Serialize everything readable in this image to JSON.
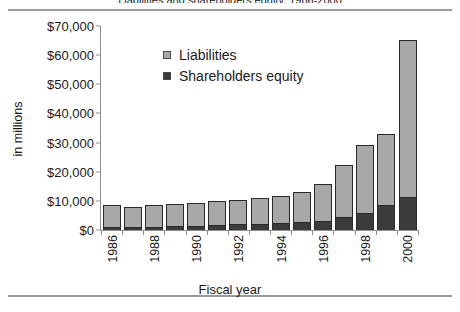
{
  "figure": {
    "title": "Liabilities and shareholders equity, 1986-2000",
    "y_axis_label": "in millions",
    "x_axis_label": "Fiscal year"
  },
  "legend": {
    "items": [
      {
        "label": "Liabilities",
        "color": "#a8a8a8",
        "swatch": "legend-swatch-liabilities"
      },
      {
        "label": "Shareholders equity",
        "color": "#3b3b3b",
        "swatch": "legend-swatch-equity"
      }
    ]
  },
  "axes": {
    "y_ticks": [
      "$70,000",
      "$60,000",
      "$50,000",
      "$40,000",
      "$30,000",
      "$20,000",
      "$10,000",
      "$0"
    ],
    "x_ticks_visible": [
      "1986",
      "1988",
      "1990",
      "1992",
      "1994",
      "1996",
      "1998",
      "2000"
    ]
  },
  "chart_data": {
    "type": "bar",
    "stacked": true,
    "title": "Liabilities and shareholders equity, 1986-2000",
    "xlabel": "Fiscal year",
    "ylabel": "in millions",
    "ylim": [
      0,
      70000
    ],
    "ytick_step": 10000,
    "grid": false,
    "legend_position": "inside-top-left",
    "categories": [
      "1986",
      "1987",
      "1988",
      "1989",
      "1990",
      "1991",
      "1992",
      "1993",
      "1994",
      "1995",
      "1996",
      "1997",
      "1998",
      "1999",
      "2000"
    ],
    "xtick_labels_shown": [
      "1986",
      "",
      "1988",
      "",
      "1990",
      "",
      "1992",
      "",
      "1994",
      "",
      "1996",
      "",
      "1998",
      "",
      "2000"
    ],
    "series": [
      {
        "name": "Shareholders equity",
        "color": "#3b3b3b",
        "values": [
          1000,
          900,
          1100,
          1300,
          1500,
          1700,
          1900,
          2100,
          2400,
          2700,
          3200,
          4300,
          6000,
          8500,
          11200
        ]
      },
      {
        "name": "Liabilities",
        "color": "#a8a8a8",
        "values": [
          7300,
          6700,
          7000,
          7300,
          7600,
          7800,
          8100,
          8500,
          9000,
          10000,
          12300,
          17700,
          23000,
          24000,
          53800
        ]
      }
    ],
    "totals": [
      8300,
      7600,
      8100,
      8600,
      9100,
      9500,
      10000,
      10600,
      11400,
      12700,
      15500,
      22000,
      29000,
      32500,
      65000
    ]
  }
}
